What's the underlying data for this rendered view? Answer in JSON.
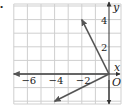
{
  "figure": {
    "bullet": "•",
    "axes": {
      "x_label": "x",
      "y_label": "y",
      "origin_label": "O",
      "x_range": [
        -7,
        0.6
      ],
      "y_range": [
        -2.2,
        5.1
      ],
      "x_ticks": [
        {
          "value": -6,
          "label": "−6"
        },
        {
          "value": -4,
          "label": "−4"
        },
        {
          "value": -2,
          "label": "−2"
        }
      ],
      "y_ticks": [
        {
          "value": 2,
          "label": "2"
        },
        {
          "value": 4,
          "label": "4"
        }
      ],
      "grid_step": 1
    },
    "vectors": [
      {
        "name": "vector-a",
        "from": [
          0,
          0
        ],
        "to": [
          -2,
          4
        ]
      },
      {
        "name": "vector-b",
        "from": [
          0,
          0
        ],
        "to": [
          -7,
          0
        ]
      },
      {
        "name": "vector-c",
        "from": [
          0,
          0
        ],
        "to": [
          -4,
          -2
        ]
      }
    ],
    "colors": {
      "grid": "#cfcfcf",
      "axis": "#333333",
      "vector": "#555555",
      "text": "#222222"
    }
  }
}
